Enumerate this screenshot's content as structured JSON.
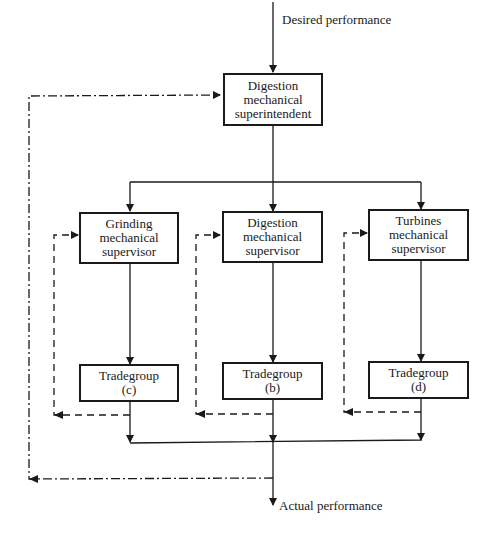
{
  "diagram": {
    "type": "hierarchical control feedback diagram",
    "input_label": "Desired performance",
    "output_label": "Actual performance",
    "top": {
      "lines": [
        "Digestion",
        "mechanical",
        "superintendent"
      ]
    },
    "supervisors": [
      {
        "id": "grinding",
        "lines": [
          "Grinding",
          "mechanical",
          "supervisor"
        ]
      },
      {
        "id": "digestion",
        "lines": [
          "Digestion",
          "mechanical",
          "supervisor"
        ]
      },
      {
        "id": "turbines",
        "lines": [
          "Turbines",
          "mechanical",
          "supervisor"
        ]
      }
    ],
    "tradegroups": [
      {
        "id": "c",
        "lines": [
          "Tradegroup",
          "(c)"
        ]
      },
      {
        "id": "b",
        "lines": [
          "Tradegroup",
          "(b)"
        ]
      },
      {
        "id": "d",
        "lines": [
          "Tradegroup",
          "(d)"
        ]
      }
    ],
    "line_styles": {
      "forward": "solid",
      "local_feedback": "dashed",
      "global_feedback": "dash-dot"
    },
    "colors": {
      "ink": "#1a1a1a",
      "background": "#ffffff"
    }
  }
}
